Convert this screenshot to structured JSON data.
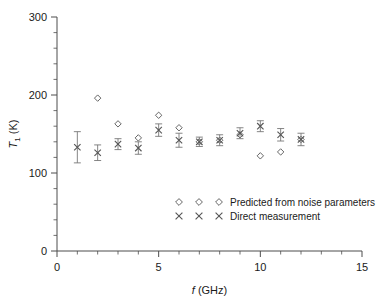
{
  "chart_data": {
    "type": "scatter",
    "title": "",
    "xlabel": "f (GHz)",
    "ylabel": "T₁ (K)",
    "xlim": [
      0,
      15
    ],
    "ylim": [
      0,
      300
    ],
    "grid": false,
    "x_major_ticks": [
      0,
      5,
      10,
      15
    ],
    "x_major_tick_labels": [
      "0",
      "5",
      "10",
      "15"
    ],
    "x_minor_tick_step": 1,
    "y_major_ticks": [
      0,
      100,
      200,
      300
    ],
    "y_major_tick_labels": [
      "0",
      "100",
      "200",
      "300"
    ],
    "y_minor_tick_step": 20,
    "legend_position": "inside-lower-center",
    "series": [
      {
        "name": "Predicted from noise parameters",
        "marker": "diamond",
        "x": [
          2,
          3,
          4,
          5,
          6,
          7,
          8,
          9,
          10,
          11,
          12
        ],
        "values": [
          196,
          163,
          145,
          174,
          158,
          140,
          142,
          149,
          122,
          127,
          143
        ],
        "yerr": [
          null,
          null,
          null,
          null,
          null,
          null,
          null,
          null,
          null,
          null,
          null
        ]
      },
      {
        "name": "Direct measurement",
        "marker": "cross",
        "x": [
          1,
          2,
          3,
          4,
          5,
          6,
          7,
          8,
          9,
          10,
          11,
          12
        ],
        "values": [
          133,
          126,
          137,
          132,
          155,
          142,
          140,
          142,
          151,
          160,
          149,
          143
        ],
        "yerr": [
          20,
          10,
          7,
          8,
          8,
          9,
          6,
          7,
          7,
          7,
          8,
          8
        ]
      }
    ]
  },
  "axes": {
    "y_label_main": "T",
    "y_label_sub": "1",
    "y_label_unit": " (K)",
    "x_label_italic": "f",
    "x_label_unit": " (GHz)"
  },
  "legend": {
    "entries": [
      {
        "label": "Predicted from noise parameters",
        "marker": "diamond"
      },
      {
        "label": "Direct measurement",
        "marker": "cross"
      }
    ]
  },
  "colors": {
    "axis": "#4d4d4d",
    "marker": "#555555",
    "errorbar": "#777777",
    "text": "#1a1a1a",
    "background": "#ffffff"
  }
}
